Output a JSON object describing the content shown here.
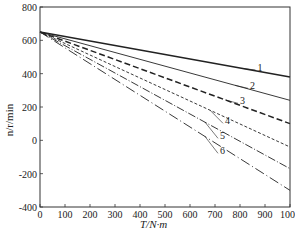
{
  "chart_data": {
    "type": "line",
    "title": "",
    "xlabel": "T/N·m",
    "ylabel": "n/r/min",
    "xlim": [
      0,
      1000
    ],
    "ylim": [
      -400,
      800
    ],
    "xticks": [
      0,
      100,
      200,
      300,
      400,
      500,
      600,
      700,
      800,
      900,
      1000
    ],
    "yticks": [
      -400,
      -200,
      0,
      200,
      400,
      600,
      800
    ],
    "grid": false,
    "legend": "inline numeric labels 1-6 with leader lines",
    "x": [
      0,
      1000
    ],
    "series": [
      {
        "name": "1",
        "values": [
          650,
          380
        ],
        "style": "solid-thick"
      },
      {
        "name": "2",
        "values": [
          650,
          240
        ],
        "style": "solid"
      },
      {
        "name": "3",
        "values": [
          650,
          100
        ],
        "style": "dashed-thick"
      },
      {
        "name": "4",
        "values": [
          650,
          -40
        ],
        "style": "dashed-fine"
      },
      {
        "name": "5",
        "values": [
          650,
          -170
        ],
        "style": "dash-dot"
      },
      {
        "name": "6",
        "values": [
          650,
          -300
        ],
        "style": "long-dash-dot"
      }
    ],
    "annotations": [
      {
        "label": "1",
        "x": 870,
        "y": 440
      },
      {
        "label": "2",
        "x": 840,
        "y": 330
      },
      {
        "label": "3",
        "x": 800,
        "y": 240
      },
      {
        "label": "4",
        "x": 740,
        "y": 120
      },
      {
        "label": "5",
        "x": 720,
        "y": 30
      },
      {
        "label": "6",
        "x": 720,
        "y": -60
      }
    ]
  }
}
